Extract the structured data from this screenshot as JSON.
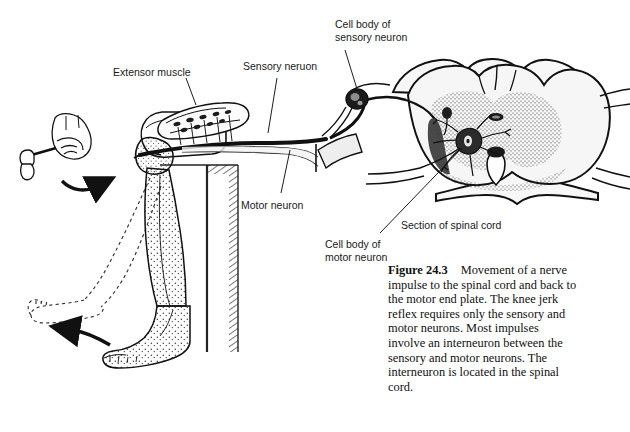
{
  "figure": {
    "number": "Figure 24.3",
    "caption_text": "Movement of a nerve impulse to the spinal cord and back to the motor end plate. The knee jerk reflex requires only the sensory and motor neurons. Most impulses involve an interneuron between the sensory and motor neurons. The interneuron is located in the spinal cord.",
    "style": "grayscale line drawing with stipple shading"
  },
  "labels": {
    "extensor_muscle": "Extensor muscle",
    "sensory_neuron": "Sensory neruon",
    "motor_neuron": "Motor neuron",
    "cell_body_sensory": "Cell body of\nsensory neuron",
    "cell_body_sensory_line1": "Cell body of",
    "cell_body_sensory_line2": "sensory neuron",
    "cell_body_motor_line1": "Cell body of",
    "cell_body_motor_line2": "motor neuron",
    "section_of_spinal_cord": "Section of spinal cord"
  },
  "anatomy": {
    "parts": [
      "reflex-hammer",
      "hand",
      "strike-arrow",
      "thigh",
      "knee",
      "lower-leg",
      "foot",
      "kicked-leg-outline",
      "kick-arrow",
      "extensor-muscle",
      "motor-end-plates",
      "sensory-axon",
      "motor-axon",
      "dorsal-root-ganglion",
      "spinal-cord-section",
      "gray-matter",
      "white-matter",
      "central-canal",
      "motor-neuron-cell-body",
      "dorsal-root",
      "ventral-root",
      "bench-edge"
    ]
  },
  "colors": {
    "ink": "#111111",
    "background": "#ffffff",
    "stipple": "#4a4a4a",
    "graymatter_fill": "#ededed",
    "whitematter_fill": "#f6f6f6",
    "dark_cell": "#1c1c1c"
  }
}
